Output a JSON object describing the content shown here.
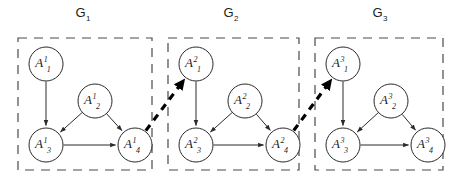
{
  "diagram": {
    "canvas": {
      "width": 462,
      "height": 189
    },
    "colors": {
      "background": "#ffffff",
      "node_stroke": "#2b2b2b",
      "node_fill": "#ffffff",
      "inner_edge": "#2b2b2b",
      "cross_edge": "#000000",
      "group_border": "#4a4a4a",
      "text": "#1c1c1c"
    },
    "groups": [
      {
        "id": "G1",
        "title_base": "G",
        "title_sub": "1",
        "title_x": 83,
        "title_y": 17,
        "box": {
          "x": 18,
          "y": 38,
          "width": 134,
          "height": 132
        },
        "nodes": [
          {
            "id": "A1_1",
            "base": "A",
            "sup": "1",
            "sub": "1",
            "cx": 46,
            "cy": 64,
            "r": 17
          },
          {
            "id": "A1_2",
            "base": "A",
            "sup": "1",
            "sub": "2",
            "cx": 95,
            "cy": 101,
            "r": 17
          },
          {
            "id": "A1_3",
            "base": "A",
            "sup": "1",
            "sub": "3",
            "cx": 46,
            "cy": 145,
            "r": 17
          },
          {
            "id": "A1_4",
            "base": "A",
            "sup": "1",
            "sub": "4",
            "cx": 135,
            "cy": 145,
            "r": 17
          }
        ],
        "edges": [
          {
            "from": "A1_1",
            "to": "A1_3"
          },
          {
            "from": "A1_2",
            "to": "A1_3"
          },
          {
            "from": "A1_2",
            "to": "A1_4"
          },
          {
            "from": "A1_3",
            "to": "A1_4"
          }
        ]
      },
      {
        "id": "G2",
        "title_base": "G",
        "title_sub": "2",
        "title_x": 231,
        "title_y": 17,
        "box": {
          "x": 168,
          "y": 38,
          "width": 131,
          "height": 132
        },
        "nodes": [
          {
            "id": "A2_1",
            "base": "A",
            "sup": "2",
            "sub": "1",
            "cx": 196,
            "cy": 64,
            "r": 17
          },
          {
            "id": "A2_2",
            "base": "A",
            "sup": "2",
            "sub": "2",
            "cx": 245,
            "cy": 101,
            "r": 17
          },
          {
            "id": "A2_3",
            "base": "A",
            "sup": "2",
            "sub": "3",
            "cx": 196,
            "cy": 145,
            "r": 17
          },
          {
            "id": "A2_4",
            "base": "A",
            "sup": "2",
            "sub": "4",
            "cx": 283,
            "cy": 145,
            "r": 17
          }
        ],
        "edges": [
          {
            "from": "A2_1",
            "to": "A2_3"
          },
          {
            "from": "A2_2",
            "to": "A2_3"
          },
          {
            "from": "A2_2",
            "to": "A2_4"
          },
          {
            "from": "A2_3",
            "to": "A2_4"
          }
        ]
      },
      {
        "id": "G3",
        "title_base": "G",
        "title_sub": "3",
        "title_x": 380,
        "title_y": 17,
        "box": {
          "x": 315,
          "y": 38,
          "width": 128,
          "height": 132
        },
        "nodes": [
          {
            "id": "A3_1",
            "base": "A",
            "sup": "3",
            "sub": "1",
            "cx": 343,
            "cy": 64,
            "r": 17
          },
          {
            "id": "A3_2",
            "base": "A",
            "sup": "3",
            "sub": "2",
            "cx": 391,
            "cy": 101,
            "r": 17
          },
          {
            "id": "A3_3",
            "base": "A",
            "sup": "3",
            "sub": "3",
            "cx": 343,
            "cy": 145,
            "r": 17
          },
          {
            "id": "A3_4",
            "base": "A",
            "sup": "3",
            "sub": "4",
            "cx": 428,
            "cy": 145,
            "r": 17
          }
        ],
        "edges": [
          {
            "from": "A3_1",
            "to": "A3_3"
          },
          {
            "from": "A3_2",
            "to": "A3_3"
          },
          {
            "from": "A3_2",
            "to": "A3_4"
          },
          {
            "from": "A3_3",
            "to": "A3_4"
          }
        ]
      }
    ],
    "cross_edges": [
      {
        "id": "link-g1-g2",
        "from": "A1_4",
        "to": "A2_1",
        "style": "thick-dashed"
      },
      {
        "id": "link-g2-g3",
        "from": "A2_4",
        "to": "A3_1",
        "style": "thick-dashed"
      }
    ]
  }
}
